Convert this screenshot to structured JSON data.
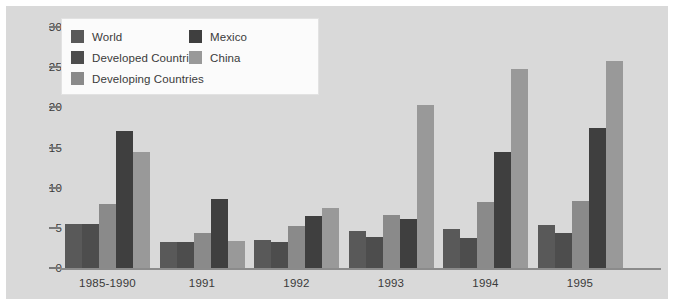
{
  "chart_data": {
    "type": "bar",
    "title": "",
    "subtitle": "",
    "xlabel": "",
    "ylabel": "",
    "ylim": [
      0,
      30
    ],
    "yticks": [
      0,
      5,
      10,
      15,
      20,
      25,
      30
    ],
    "grid": false,
    "legend_position": "top-left",
    "categories": [
      "1985-1990",
      "1991",
      "1992",
      "1993",
      "1994",
      "1995"
    ],
    "series": [
      {
        "name": "World",
        "color": "#595959",
        "values": [
          5.5,
          3.2,
          3.5,
          4.6,
          4.9,
          5.4
        ]
      },
      {
        "name": "Developed Countries",
        "color": "#4d4d4d",
        "values": [
          5.5,
          3.2,
          3.2,
          3.8,
          3.7,
          4.3
        ]
      },
      {
        "name": "Developing Countries",
        "color": "#8a8a8a",
        "values": [
          8.0,
          4.4,
          5.2,
          6.6,
          8.2,
          8.3
        ]
      },
      {
        "name": "Mexico",
        "color": "#3f3f3f",
        "values": [
          17.0,
          8.6,
          6.5,
          6.1,
          14.5,
          17.4
        ]
      },
      {
        "name": "China",
        "color": "#999999",
        "values": [
          14.5,
          3.4,
          7.5,
          20.3,
          24.8,
          25.8
        ]
      }
    ]
  },
  "axis": {
    "y_tick_labels": [
      "0",
      "5",
      "10",
      "15",
      "20",
      "25",
      "30"
    ]
  },
  "legend": {
    "left_column": [
      {
        "label": "World"
      },
      {
        "label": "Developed Countries"
      },
      {
        "label": "Developing Countries"
      }
    ],
    "right_column": [
      {
        "label": "Mexico"
      },
      {
        "label": "China"
      }
    ]
  },
  "colors": {
    "panel_background": "#d9d9d9",
    "page_background": "#ffffff",
    "axis_line": "#8b8b8b",
    "text": "#3a3a3a",
    "legend_background": "#fbfbfb",
    "legend_border": "#e2e2e2"
  }
}
